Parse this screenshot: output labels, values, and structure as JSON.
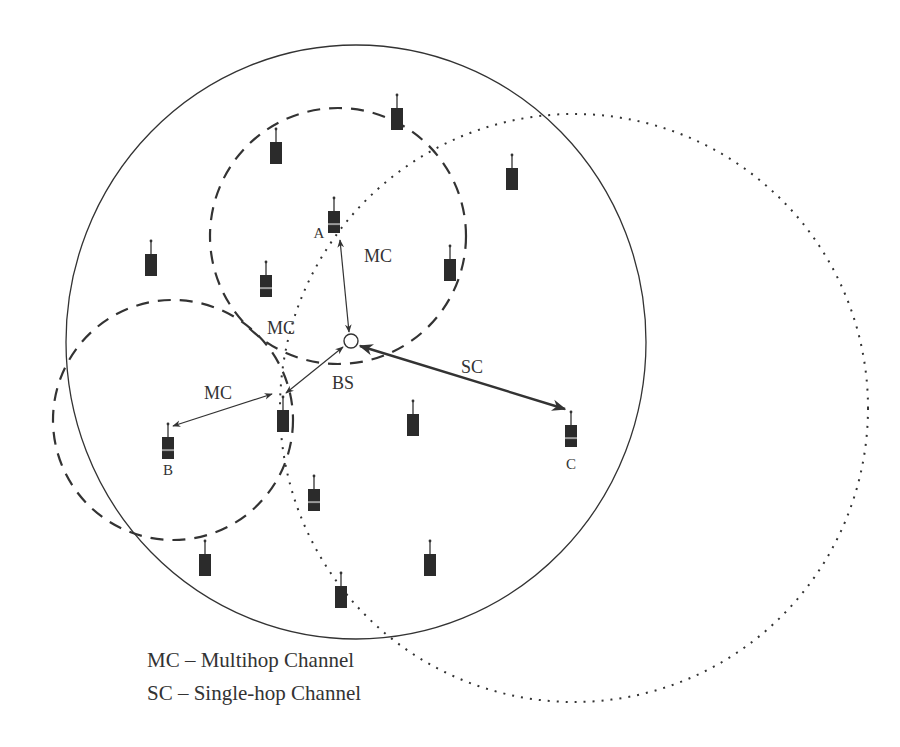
{
  "diagram": {
    "title": "",
    "colors": {
      "ink": "#333333",
      "device": "#2b2b2b",
      "background": "#ffffff"
    },
    "ranges": {
      "cell": {
        "style": "solid",
        "cx": 356,
        "cy": 342,
        "rx": 290,
        "ry": 297
      },
      "relay_A": {
        "style": "dashed",
        "cx": 338,
        "cy": 236,
        "r": 128
      },
      "relay_B": {
        "style": "dashed",
        "cx": 173,
        "cy": 420,
        "r": 120
      },
      "adjacent": {
        "style": "dotted",
        "cx": 574,
        "cy": 408,
        "r": 294
      }
    },
    "base_station": {
      "label": "BS",
      "x": 351,
      "y": 341,
      "r": 7,
      "label_x": 343,
      "label_y": 389
    },
    "devices": [
      {
        "id": "d1",
        "label": "",
        "x": 276,
        "y": 142,
        "striped": false
      },
      {
        "id": "d2",
        "label": "",
        "x": 397,
        "y": 108,
        "striped": false
      },
      {
        "id": "d3",
        "label": "",
        "x": 512,
        "y": 168,
        "striped": false
      },
      {
        "id": "A",
        "label": "A",
        "x": 334,
        "y": 211,
        "striped": true,
        "label_x": 319,
        "label_y": 238
      },
      {
        "id": "d5",
        "label": "",
        "x": 151,
        "y": 254,
        "striped": false
      },
      {
        "id": "d6",
        "label": "",
        "x": 266,
        "y": 275,
        "striped": true
      },
      {
        "id": "d7",
        "label": "",
        "x": 450,
        "y": 259,
        "striped": false
      },
      {
        "id": "B",
        "label": "B",
        "x": 168,
        "y": 437,
        "striped": true,
        "label_x": 168,
        "label_y": 475
      },
      {
        "id": "relay",
        "label": "",
        "x": 283,
        "y": 410,
        "striped": false
      },
      {
        "id": "d10",
        "label": "",
        "x": 413,
        "y": 414,
        "striped": false
      },
      {
        "id": "C",
        "label": "C",
        "x": 571,
        "y": 425,
        "striped": true,
        "label_x": 571,
        "label_y": 469
      },
      {
        "id": "d12",
        "label": "",
        "x": 314,
        "y": 489,
        "striped": true
      },
      {
        "id": "d13",
        "label": "",
        "x": 205,
        "y": 554,
        "striped": false
      },
      {
        "id": "d14",
        "label": "",
        "x": 430,
        "y": 554,
        "striped": false
      },
      {
        "id": "d15",
        "label": "",
        "x": 341,
        "y": 586,
        "striped": false
      }
    ],
    "links": [
      {
        "id": "A-BS",
        "type": "MC",
        "label": "MC",
        "x1": 340,
        "y1": 240,
        "x2": 349,
        "y2": 332,
        "width": 1.2,
        "label_x": 364,
        "label_y": 262
      },
      {
        "id": "relay-BS",
        "type": "MC",
        "label": "MC",
        "x1": 286,
        "y1": 393,
        "x2": 343,
        "y2": 347,
        "width": 1.2,
        "label_x": 267,
        "label_y": 334
      },
      {
        "id": "B-relay",
        "type": "MC",
        "label": "MC",
        "x1": 173,
        "y1": 426,
        "x2": 272,
        "y2": 394,
        "width": 1.2,
        "label_x": 204,
        "label_y": 399
      },
      {
        "id": "BS-C",
        "type": "SC",
        "label": "SC",
        "x1": 360,
        "y1": 346,
        "x2": 565,
        "y2": 409,
        "width": 2.4,
        "label_x": 461,
        "label_y": 373
      }
    ]
  },
  "legend": {
    "items": [
      {
        "abbr": "MC",
        "text": "MC – Multihop Channel"
      },
      {
        "abbr": "SC",
        "text": "SC – Single-hop Channel"
      }
    ]
  }
}
